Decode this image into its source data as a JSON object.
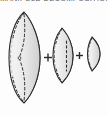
{
  "figure": {
    "caption_clipped": "MANIFOLD DECOMPOSITION",
    "background_color": "#fdfdfd",
    "operators": [
      {
        "symbol": "+",
        "x": 46,
        "y": 51
      },
      {
        "symbol": "+",
        "x": 77,
        "y": 49
      }
    ],
    "shapes": [
      {
        "name": "lens-solid-large",
        "fill_light": "#efefef",
        "fill_mid": "#d8d8d8",
        "fill_dark": "#c2c2c2",
        "stroke": "#2b2b2b",
        "dashed_stroke": "#2b2b2b",
        "center_x": 26,
        "center_y": 57,
        "half_height": 46,
        "half_width": 19,
        "has_dashed_meridian": true,
        "has_dashed_chord": true
      },
      {
        "name": "lens-solid-medium",
        "fill_light": "#efefef",
        "fill_mid": "#d8d8d8",
        "fill_dark": "#c2c2c2",
        "stroke": "#2b2b2b",
        "dashed_stroke": "#2b2b2b",
        "center_x": 63,
        "center_y": 55,
        "half_height": 28,
        "half_width": 11,
        "has_dashed_meridian": true,
        "has_dashed_chord": false
      },
      {
        "name": "lens-solid-small",
        "fill_light": "#efefef",
        "fill_mid": "#d8d8d8",
        "fill_dark": "#c2c2c2",
        "stroke": "#2b2b2b",
        "dashed_stroke": "#2b2b2b",
        "center_x": 94,
        "center_y": 53,
        "half_height": 17,
        "half_width": 7,
        "has_dashed_meridian": true,
        "has_dashed_chord": false,
        "clipped_right_edge": true
      }
    ]
  }
}
